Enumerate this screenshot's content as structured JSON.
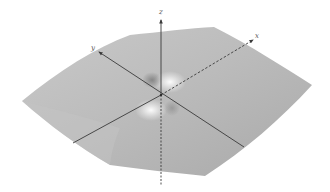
{
  "figure": {
    "colors": {
      "background": "#ffffff",
      "surface_light": "#e6e6e6",
      "surface_mid": "#bdbdbd",
      "surface_dark": "#9a9a9a",
      "axis": "#3a3a3a",
      "label": "#555555"
    },
    "axes": {
      "x": {
        "label": "x"
      },
      "y": {
        "label": "y"
      },
      "z": {
        "label": "z"
      }
    }
  }
}
